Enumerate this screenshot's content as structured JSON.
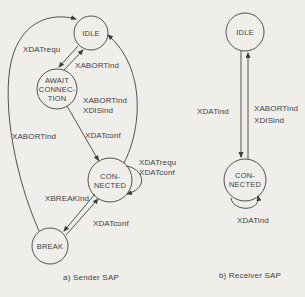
{
  "colors": {
    "background": "#f0eeeb",
    "ink": "#3f3f3f"
  },
  "sender": {
    "caption": "a) Sender SAP",
    "states": {
      "idle": "IDLE",
      "await_line1": "AWAIT",
      "await_line2": "CONNEC-",
      "await_line3": "TION",
      "connected_line1": "CON-",
      "connected_line2": "NECTED",
      "break": "BREAK"
    },
    "transitions": {
      "idle_to_await": "XDATrequ",
      "await_to_idle": "XABORTind",
      "connected_to_idle_line1": "XABORTind",
      "connected_to_idle_line2": "XDISind",
      "break_to_idle": "XABORTind",
      "await_to_connected": "XDATconf",
      "connected_self_line1": "XDATrequ",
      "connected_self_line2": "XDATconf",
      "connected_to_break": "XBREAKind",
      "break_to_connected": "XDATconf"
    }
  },
  "receiver": {
    "caption": "b) Receiver SAP",
    "states": {
      "idle": "IDLE",
      "connected_line1": "CON-",
      "connected_line2": "NECTED"
    },
    "transitions": {
      "idle_to_connected": "XDATind",
      "connected_to_idle_line1": "XABORTind",
      "connected_to_idle_line2": "XDISind",
      "connected_self": "XDATind"
    }
  }
}
